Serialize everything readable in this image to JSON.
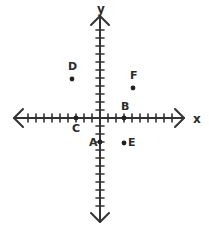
{
  "figure": {
    "stroke_color": "#333333",
    "point_color": "#222222",
    "background": "#ffffff",
    "width": 209,
    "height": 233
  },
  "axes": {
    "x": {
      "label": "x",
      "label_x": 193,
      "label_y": 113,
      "origin_px": 100,
      "start_px": 14,
      "end_px": 184,
      "tick_spacing_px": 8,
      "ticks_negative": 10,
      "ticks_positive": 10,
      "arrows": "both"
    },
    "y": {
      "label": "y",
      "label_x": 97,
      "label_y": 3,
      "origin_px": 118,
      "start_px": 16,
      "end_px": 222,
      "tick_spacing_px": 8,
      "ticks_positive": 11,
      "ticks_negative": 11,
      "arrows": "both"
    }
  },
  "chart_data": {
    "type": "scatter",
    "title": "",
    "xlabel": "x",
    "ylabel": "y",
    "xlim": [
      -10,
      10
    ],
    "ylim": [
      -12,
      12
    ],
    "grid": false,
    "legend": "none",
    "points": [
      {
        "name": "A",
        "x": 0,
        "y": -3,
        "px": 100,
        "py": 142,
        "label_dx": -11,
        "label_dy": -5
      },
      {
        "name": "B",
        "x": 3,
        "y": 0,
        "px": 124,
        "py": 118,
        "label_dx": -3,
        "label_dy": -17
      },
      {
        "name": "C",
        "x": -3,
        "y": 0,
        "px": 76,
        "py": 118,
        "label_dx": -4,
        "label_dy": 5
      },
      {
        "name": "D",
        "x": -3.5,
        "y": 5,
        "px": 72,
        "py": 79,
        "label_dx": -4,
        "label_dy": -18
      },
      {
        "name": "E",
        "x": 3,
        "y": -3,
        "px": 124,
        "py": 143,
        "label_dx": 4,
        "label_dy": -6
      },
      {
        "name": "F",
        "x": 4,
        "y": 3.75,
        "px": 133,
        "py": 88,
        "label_dx": -3,
        "label_dy": -18
      }
    ]
  }
}
